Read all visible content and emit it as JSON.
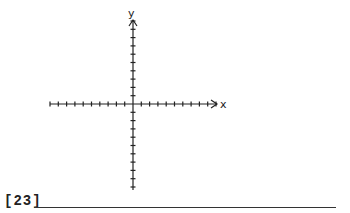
{
  "graph": {
    "x_axis_label": "x",
    "y_axis_label": "y",
    "x_ticks_left": 10,
    "x_ticks_right": 10,
    "y_ticks_up": 10,
    "y_ticks_down": 10,
    "line_color": "#222222"
  },
  "problem": {
    "number_label": "[23]",
    "answer_value": ""
  }
}
